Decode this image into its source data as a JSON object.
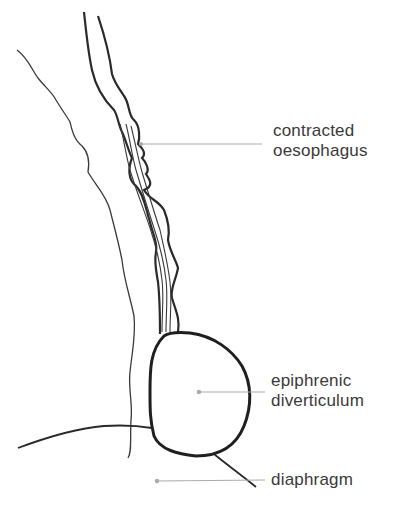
{
  "diagram": {
    "labels": [
      {
        "id": "contracted-oesophagus",
        "line1": "contracted",
        "line2": "oesophagus"
      },
      {
        "id": "epiphrenic-diverticulum",
        "line1": "epiphrenic",
        "line2": "diverticulum"
      },
      {
        "id": "diaphragm",
        "line1": "diaphragm"
      }
    ],
    "colors": {
      "outline": "#2a2a2a",
      "leader_line": "#aaaaaa",
      "label_text": "#3a3a3a",
      "background": "#ffffff"
    }
  }
}
